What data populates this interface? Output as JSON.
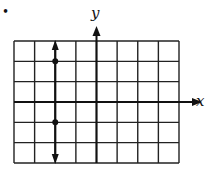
{
  "bullet": "•",
  "chart_data": {
    "type": "line",
    "title": "",
    "xlabel": "x",
    "ylabel": "y",
    "grid": true,
    "x_range": [
      -4,
      4
    ],
    "y_range": [
      -3,
      3
    ],
    "columns": 8,
    "rows": 6,
    "tick_labels_shown": false,
    "series": [
      {
        "name": "vertical line x = -2",
        "kind": "vertical-line",
        "x": -2,
        "arrows": "both",
        "points": [
          {
            "x": -2,
            "y": 2
          },
          {
            "x": -2,
            "y": -1
          }
        ]
      }
    ]
  },
  "colors": {
    "ink": "#111111",
    "grid": "#222222",
    "background": "#ffffff"
  }
}
